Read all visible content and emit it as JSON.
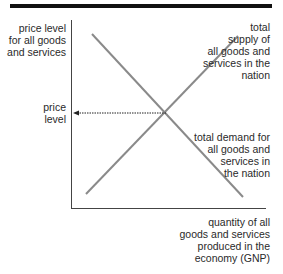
{
  "diagram": {
    "type": "aggregate supply and demand",
    "y_axis_label": "price level\nfor all goods\nand services",
    "x_axis_label": "quantity of all\ngoods and services\nproduced in the\neconomy (GNP)",
    "equilibrium_label": "price\nlevel",
    "supply_label": "total\nsupply of\nall goods and\nservices in the\nnation",
    "demand_label": "total demand for\nall goods and\nservices in\nthe nation",
    "colors": {
      "axes": "#444444",
      "curves": "#8a8a8a",
      "top_bar": "#111111",
      "arrow": "#222222"
    }
  }
}
